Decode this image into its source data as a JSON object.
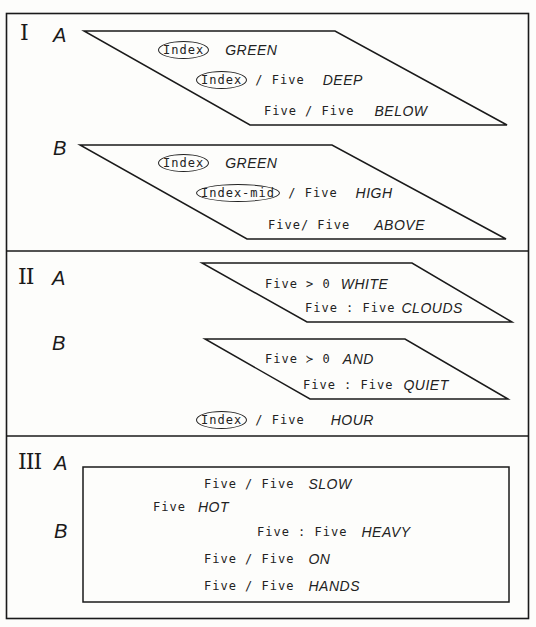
{
  "sections": [
    {
      "numeral": "I",
      "groups": [
        {
          "label": "A",
          "lines": [
            {
              "circled": "Index",
              "middle": "",
              "word": "GREEN"
            },
            {
              "circled": "Index",
              "middle": " / Five",
              "word": "DEEP"
            },
            {
              "circled": "",
              "middle": "Five / Five",
              "word": "BELOW"
            }
          ]
        },
        {
          "label": "B",
          "lines": [
            {
              "circled": "Index",
              "middle": "",
              "word": "GREEN"
            },
            {
              "circled": "Index-mid",
              "middle": " / Five",
              "word": "HIGH"
            },
            {
              "circled": "",
              "middle": "Five/ Five",
              "word": "ABOVE"
            }
          ]
        }
      ]
    },
    {
      "numeral": "II",
      "groups": [
        {
          "label": "A",
          "lines": [
            {
              "circled": "",
              "middle": "Five > 0",
              "word": "WHITE"
            },
            {
              "circled": "",
              "middle": "Five : Five",
              "word": "CLOUDS"
            }
          ]
        },
        {
          "label": "B",
          "lines": [
            {
              "circled": "",
              "middle": "Five ≻ 0",
              "word": "AND"
            },
            {
              "circled": "",
              "middle": "Five : Five",
              "word": "QUIET"
            }
          ]
        }
      ],
      "trailing_line": {
        "circled": "Index",
        "middle": " / Five",
        "word": "HOUR"
      }
    },
    {
      "numeral": "III",
      "groups": [
        {
          "label": "A"
        },
        {
          "label": "B"
        }
      ],
      "box_lines": [
        {
          "middle": "Five / Five",
          "word": "SLOW"
        },
        {
          "middle": "Five",
          "word": "HOT"
        },
        {
          "middle": "Five : Five",
          "word": "HEAVY"
        },
        {
          "middle": "Five / Five",
          "word": "ON"
        },
        {
          "middle": "Five / Five",
          "word": "HANDS"
        }
      ]
    }
  ],
  "colors": {
    "ink": "#1a1a1a",
    "paper": "#fdfdfb"
  }
}
